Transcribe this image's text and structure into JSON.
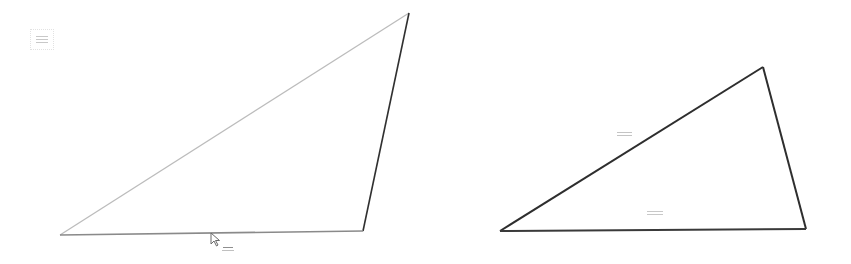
{
  "canvas": {
    "width": 851,
    "height": 264,
    "background": "#ffffff"
  },
  "colors": {
    "stroke_light": "#b5b5b5",
    "stroke_dark": "#2e2e2e",
    "label": "#bdbdbd"
  },
  "legend": {
    "label": "—"
  },
  "left_triangle": {
    "vertices": [
      [
        60,
        235
      ],
      [
        409,
        13
      ],
      [
        363,
        231
      ]
    ],
    "bottom_label": "—"
  },
  "right_triangle": {
    "vertices": [
      [
        500,
        231
      ],
      [
        763,
        67
      ],
      [
        806,
        229
      ]
    ],
    "side_label": "—",
    "inner_label": "—"
  },
  "cursor": {
    "x": 210,
    "y": 232,
    "icon": "arrow-cursor-icon"
  }
}
